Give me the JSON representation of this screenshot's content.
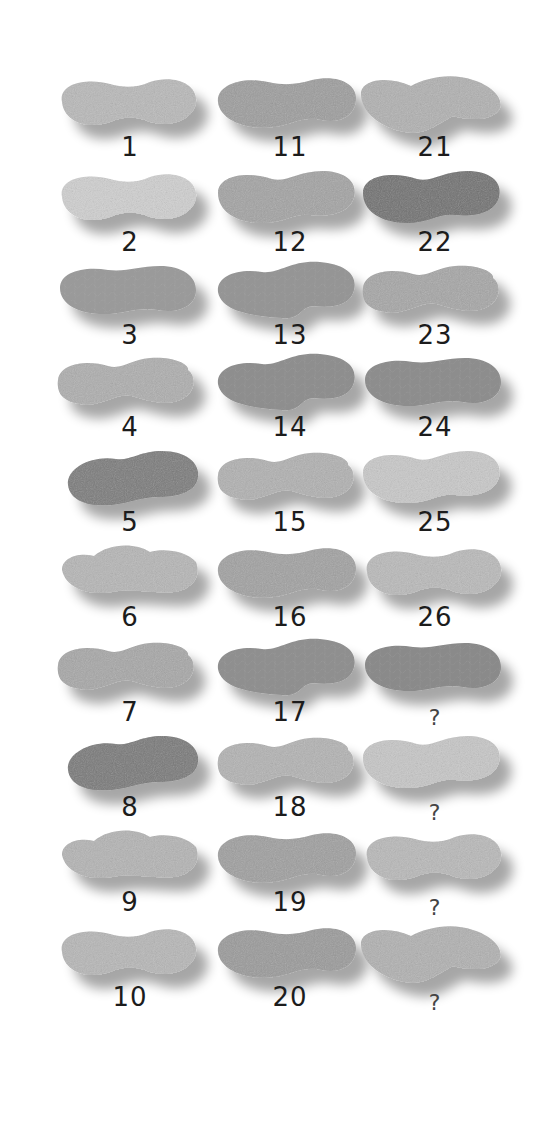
{
  "puzzle": {
    "columns": 3,
    "rows": 10,
    "items": [
      {
        "label": "1",
        "col": 0,
        "row": 0,
        "tone": "#b8b8b8",
        "shape": "a",
        "pattern": "speckle"
      },
      {
        "label": "2",
        "col": 0,
        "row": 1,
        "tone": "#cfcfcf",
        "shape": "a",
        "pattern": "smooth"
      },
      {
        "label": "3",
        "col": 0,
        "row": 2,
        "tone": "#9a9a9a",
        "shape": "c",
        "pattern": "net"
      },
      {
        "label": "4",
        "col": 0,
        "row": 3,
        "tone": "#adadad",
        "shape": "b",
        "pattern": "smooth"
      },
      {
        "label": "5",
        "col": 0,
        "row": 4,
        "tone": "#7a7a7a",
        "shape": "d",
        "pattern": "dark"
      },
      {
        "label": "6",
        "col": 0,
        "row": 5,
        "tone": "#b5b5b5",
        "shape": "e",
        "pattern": "speckle"
      },
      {
        "label": "7",
        "col": 0,
        "row": 6,
        "tone": "#a6a6a6",
        "shape": "b",
        "pattern": "smooth"
      },
      {
        "label": "8",
        "col": 0,
        "row": 7,
        "tone": "#787878",
        "shape": "d",
        "pattern": "dark"
      },
      {
        "label": "9",
        "col": 0,
        "row": 8,
        "tone": "#b3b3b3",
        "shape": "e",
        "pattern": "speckle"
      },
      {
        "label": "10",
        "col": 0,
        "row": 9,
        "tone": "#b6b6b6",
        "shape": "a",
        "pattern": "speckle"
      },
      {
        "label": "11",
        "col": 1,
        "row": 0,
        "tone": "#9c9c9c",
        "shape": "f",
        "pattern": "ridge"
      },
      {
        "label": "12",
        "col": 1,
        "row": 1,
        "tone": "#a2a2a2",
        "shape": "g",
        "pattern": "smooth"
      },
      {
        "label": "13",
        "col": 1,
        "row": 2,
        "tone": "#959595",
        "shape": "h",
        "pattern": "net"
      },
      {
        "label": "14",
        "col": 1,
        "row": 3,
        "tone": "#8e8e8e",
        "shape": "h",
        "pattern": "net"
      },
      {
        "label": "15",
        "col": 1,
        "row": 4,
        "tone": "#b0b0b0",
        "shape": "b",
        "pattern": "smooth"
      },
      {
        "label": "16",
        "col": 1,
        "row": 5,
        "tone": "#a0a0a0",
        "shape": "f",
        "pattern": "ridge"
      },
      {
        "label": "17",
        "col": 1,
        "row": 6,
        "tone": "#8f8f8f",
        "shape": "h",
        "pattern": "net"
      },
      {
        "label": "18",
        "col": 1,
        "row": 7,
        "tone": "#b2b2b2",
        "shape": "b",
        "pattern": "smooth"
      },
      {
        "label": "19",
        "col": 1,
        "row": 8,
        "tone": "#9e9e9e",
        "shape": "f",
        "pattern": "ridge"
      },
      {
        "label": "20",
        "col": 1,
        "row": 9,
        "tone": "#999999",
        "shape": "f",
        "pattern": "ridge"
      },
      {
        "label": "21",
        "col": 2,
        "row": 0,
        "tone": "#b0b0b0",
        "shape": "i",
        "pattern": "speckle"
      },
      {
        "label": "22",
        "col": 2,
        "row": 1,
        "tone": "#6f6f6f",
        "shape": "g",
        "pattern": "dark"
      },
      {
        "label": "23",
        "col": 2,
        "row": 2,
        "tone": "#a5a5a5",
        "shape": "b",
        "pattern": "smooth"
      },
      {
        "label": "24",
        "col": 2,
        "row": 3,
        "tone": "#8d8d8d",
        "shape": "c",
        "pattern": "net"
      },
      {
        "label": "25",
        "col": 2,
        "row": 4,
        "tone": "#c8c8c8",
        "shape": "g",
        "pattern": "smooth"
      },
      {
        "label": "26",
        "col": 2,
        "row": 5,
        "tone": "#b9b9b9",
        "shape": "a",
        "pattern": "speckle"
      },
      {
        "label": "?",
        "col": 2,
        "row": 6,
        "tone": "#8a8a8a",
        "shape": "c",
        "pattern": "net"
      },
      {
        "label": "?",
        "col": 2,
        "row": 7,
        "tone": "#c6c6c6",
        "shape": "g",
        "pattern": "smooth"
      },
      {
        "label": "?",
        "col": 2,
        "row": 8,
        "tone": "#b8b8b8",
        "shape": "a",
        "pattern": "speckle"
      },
      {
        "label": "?",
        "col": 2,
        "row": 9,
        "tone": "#b0b0b0",
        "shape": "i",
        "pattern": "speckle"
      }
    ]
  }
}
